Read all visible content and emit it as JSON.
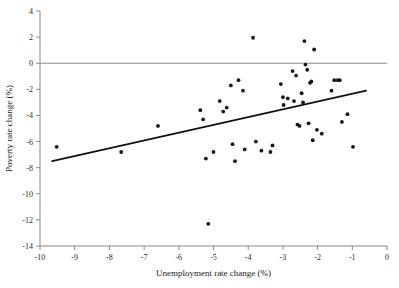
{
  "chart_data": {
    "type": "scatter",
    "title": "",
    "xlabel": "Unemployment rate change (%)",
    "ylabel": "Poverty rate change (%)",
    "xlim": [
      -10,
      0
    ],
    "ylim": [
      -14,
      4
    ],
    "xticks": [
      -10,
      -9,
      -8,
      -7,
      -6,
      -5,
      -4,
      -3,
      -2,
      -1,
      0
    ],
    "yticks": [
      4,
      2,
      0,
      -2,
      -4,
      -6,
      -8,
      -10,
      -12,
      -14
    ],
    "xtick_labels": [
      "-10",
      "-9",
      "-8",
      "-7",
      "-6",
      "-5",
      "-4",
      "-3",
      "-2",
      "-1",
      "0"
    ],
    "ytick_labels": [
      "4",
      "2",
      "0",
      "-2",
      "-4",
      "-6",
      "-8",
      "-10",
      "-12",
      "-14"
    ],
    "grid": false,
    "legend": "none",
    "marker": "filled-circle",
    "marker_color": "#161616",
    "reference_lines": [
      {
        "name": "zero-line",
        "orientation": "horizontal",
        "y": 0,
        "color": "#8a8a8a"
      }
    ],
    "trend_line": {
      "name": "linear-fit",
      "x": [
        -9.65,
        -0.6
      ],
      "y": [
        -7.5,
        -2.1
      ],
      "color": "#111111"
    },
    "points": [
      {
        "x": -9.52,
        "y": -6.4
      },
      {
        "x": -7.66,
        "y": -6.8
      },
      {
        "x": -6.6,
        "y": -4.8
      },
      {
        "x": -5.38,
        "y": -3.6
      },
      {
        "x": -5.3,
        "y": -4.3
      },
      {
        "x": -5.22,
        "y": -7.3
      },
      {
        "x": -5.15,
        "y": -12.3
      },
      {
        "x": -5.0,
        "y": -6.8
      },
      {
        "x": -4.82,
        "y": -2.9
      },
      {
        "x": -4.72,
        "y": -3.7
      },
      {
        "x": -4.62,
        "y": -3.4
      },
      {
        "x": -4.5,
        "y": -1.7
      },
      {
        "x": -4.45,
        "y": -6.2
      },
      {
        "x": -4.38,
        "y": -7.5
      },
      {
        "x": -4.28,
        "y": -1.3
      },
      {
        "x": -4.15,
        "y": -2.1
      },
      {
        "x": -4.1,
        "y": -6.6
      },
      {
        "x": -3.86,
        "y": 1.95
      },
      {
        "x": -3.78,
        "y": -6.0
      },
      {
        "x": -3.62,
        "y": -6.7
      },
      {
        "x": -3.36,
        "y": -6.8
      },
      {
        "x": -3.3,
        "y": -6.3
      },
      {
        "x": -3.06,
        "y": -1.6
      },
      {
        "x": -3.0,
        "y": -2.6
      },
      {
        "x": -2.98,
        "y": -3.2
      },
      {
        "x": -2.86,
        "y": -2.7
      },
      {
        "x": -2.72,
        "y": -0.6
      },
      {
        "x": -2.68,
        "y": -2.9
      },
      {
        "x": -2.62,
        "y": -0.95
      },
      {
        "x": -2.58,
        "y": -4.7
      },
      {
        "x": -2.52,
        "y": -4.8
      },
      {
        "x": -2.46,
        "y": -2.3
      },
      {
        "x": -2.42,
        "y": -3.0
      },
      {
        "x": -2.38,
        "y": 1.7
      },
      {
        "x": -2.35,
        "y": -0.1
      },
      {
        "x": -2.3,
        "y": -0.5
      },
      {
        "x": -2.26,
        "y": -4.6
      },
      {
        "x": -2.22,
        "y": -1.5
      },
      {
        "x": -2.18,
        "y": -1.4
      },
      {
        "x": -2.14,
        "y": -5.9
      },
      {
        "x": -2.1,
        "y": 1.05
      },
      {
        "x": -2.02,
        "y": -5.1
      },
      {
        "x": -1.88,
        "y": -5.4
      },
      {
        "x": -1.6,
        "y": -2.1
      },
      {
        "x": -1.52,
        "y": -1.3
      },
      {
        "x": -1.42,
        "y": -1.3
      },
      {
        "x": -1.36,
        "y": -1.3
      },
      {
        "x": -1.3,
        "y": -4.5
      },
      {
        "x": -1.14,
        "y": -3.9
      },
      {
        "x": -0.98,
        "y": -6.4
      }
    ]
  }
}
